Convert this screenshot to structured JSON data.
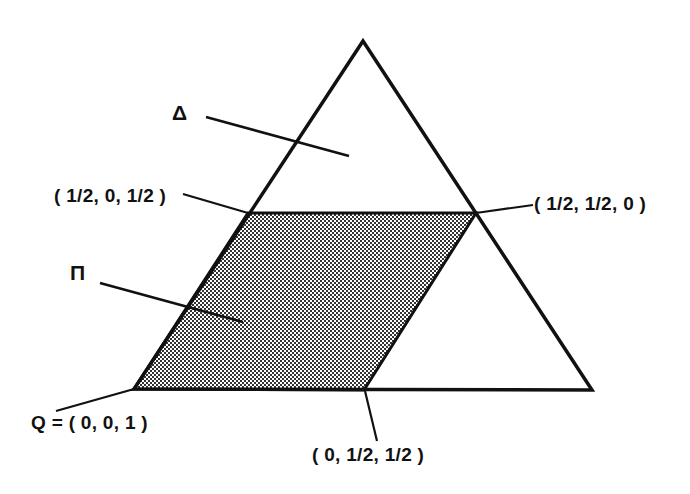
{
  "figure": {
    "background_color": "#ffffff",
    "stroke_color": "#111111",
    "fill_color": "#808080"
  },
  "shapes": {
    "triangle": {
      "name": "Delta",
      "symbol": "Δ",
      "vertices": [
        [
          363,
          41
        ],
        [
          592,
          390
        ],
        [
          134,
          389
        ]
      ],
      "filled": false
    },
    "parallelogram": {
      "name": "Pi",
      "symbol": "Π",
      "vertices": [
        [
          248,
          213
        ],
        [
          476,
          213
        ],
        [
          364,
          390
        ],
        [
          134,
          389
        ]
      ],
      "filled": true
    }
  },
  "labels": {
    "delta": "Δ",
    "pi": "Π",
    "vertex_half_0_half": "( 1/2, 0, 1/2 )",
    "vertex_half_half_0": "( 1/2, 1/2, 0 )",
    "vertex_q_origin": "Q = ( 0, 0, 1 )",
    "vertex_0_half_half": "( 0, 1/2, 1/2 )"
  },
  "leader_lines": [
    {
      "name": "delta-leader",
      "from": [
        206,
        117
      ],
      "to": [
        349,
        156
      ]
    },
    {
      "name": "pi-leader",
      "from": [
        100,
        283
      ],
      "to": [
        243,
        322
      ]
    },
    {
      "name": "half-0-half-leader",
      "from": [
        183,
        194
      ],
      "to": [
        248,
        213
      ]
    },
    {
      "name": "half-half-0-leader",
      "from": [
        476,
        213
      ],
      "to": [
        533,
        205
      ]
    },
    {
      "name": "q-origin-leader",
      "from": [
        56,
        411
      ],
      "to": [
        134,
        389
      ]
    },
    {
      "name": "0-half-half-leader",
      "from": [
        365,
        391
      ],
      "to": [
        377,
        441
      ]
    }
  ]
}
